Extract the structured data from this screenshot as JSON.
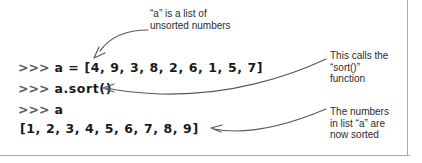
{
  "figure": {
    "name": "python-list-sort-annotated-console",
    "border_color": "#a8a8a8",
    "background": "#ffffff",
    "text_color": "#2b2b2b",
    "code_color": "#1a1a1a",
    "prompt_color": "#5c5c5c",
    "arrow_color": "#58595b"
  },
  "console": {
    "prompt": ">>>",
    "lines": [
      {
        "prompt": ">>>",
        "code": "a = [4, 9, 3, 8, 2, 6, 1, 5, 7]"
      },
      {
        "prompt": ">>>",
        "code": "a.sort()"
      },
      {
        "prompt": ">>>",
        "code": "a"
      },
      {
        "prompt": "",
        "code": "[1, 2, 3, 4, 5, 6, 7, 8, 9]"
      }
    ]
  },
  "annotations": {
    "top": {
      "line1": "“a” is a list of",
      "line2": "unsorted numbers"
    },
    "middle": {
      "line1": "This calls the",
      "line2": "“sort()”",
      "line3": "function"
    },
    "bottom": {
      "line1": "The numbers",
      "line2": "in list “a” are",
      "line3": "now sorted"
    }
  },
  "arrows": [
    {
      "name": "arrow-to-list-literal",
      "from": "top annotation",
      "to": "list of unsorted numbers"
    },
    {
      "name": "arrow-to-sort-call",
      "from": "middle annotation",
      "to": "a.sort()"
    },
    {
      "name": "arrow-to-sorted-output",
      "from": "bottom annotation",
      "to": "[1, 2, 3, 4, 5, 6, 7, 8, 9]"
    }
  ]
}
